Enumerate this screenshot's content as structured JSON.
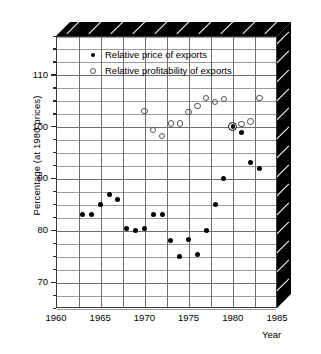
{
  "chart_data": {
    "type": "scatter",
    "title": "",
    "xlabel": "Year",
    "ylabel": "Percentage (at 1980 prices)",
    "xlim": [
      1960,
      1985
    ],
    "ylim": [
      65,
      117.5
    ],
    "xticks": [
      1960,
      1965,
      1970,
      1975,
      1980,
      1985
    ],
    "yticks": [
      70,
      80,
      90,
      100,
      110
    ],
    "y_minor_step": 2.5,
    "grid": true,
    "legend_position": "top-left inside",
    "series": [
      {
        "name": "Relative price of exports",
        "marker": "filled-circle",
        "color": "#000000",
        "points": [
          {
            "x": 1963,
            "y": 83.0
          },
          {
            "x": 1964,
            "y": 83.0
          },
          {
            "x": 1965,
            "y": 85.0
          },
          {
            "x": 1966,
            "y": 87.0
          },
          {
            "x": 1967,
            "y": 86.0
          },
          {
            "x": 1968,
            "y": 80.4
          },
          {
            "x": 1969,
            "y": 79.9
          },
          {
            "x": 1970,
            "y": 80.4
          },
          {
            "x": 1971,
            "y": 83.0
          },
          {
            "x": 1972,
            "y": 83.0
          },
          {
            "x": 1973,
            "y": 78.0
          },
          {
            "x": 1974,
            "y": 75.0
          },
          {
            "x": 1975,
            "y": 78.3
          },
          {
            "x": 1976,
            "y": 75.4
          },
          {
            "x": 1977,
            "y": 79.9
          },
          {
            "x": 1978,
            "y": 85.0
          },
          {
            "x": 1979,
            "y": 90.0
          },
          {
            "x": 1980,
            "y": 100.0
          },
          {
            "x": 1981,
            "y": 98.8
          },
          {
            "x": 1982,
            "y": 93.0
          },
          {
            "x": 1983,
            "y": 92.0
          }
        ]
      },
      {
        "name": "Relative profitability of exports",
        "marker": "open-circle",
        "color": "#555555",
        "points": [
          {
            "x": 1970,
            "y": 103.0
          },
          {
            "x": 1971,
            "y": 99.4
          },
          {
            "x": 1972,
            "y": 98.2
          },
          {
            "x": 1973,
            "y": 100.6
          },
          {
            "x": 1974,
            "y": 100.6
          },
          {
            "x": 1975,
            "y": 102.8
          },
          {
            "x": 1976,
            "y": 104.0
          },
          {
            "x": 1977,
            "y": 105.5
          },
          {
            "x": 1978,
            "y": 104.8
          },
          {
            "x": 1979,
            "y": 105.4
          },
          {
            "x": 1980,
            "y": 100.0
          },
          {
            "x": 1981,
            "y": 100.5
          },
          {
            "x": 1982,
            "y": 101.0
          },
          {
            "x": 1983,
            "y": 105.5
          }
        ]
      }
    ],
    "overlap_markers": [
      {
        "x": 1980,
        "y": 100.0,
        "note": "both series coincide"
      }
    ]
  },
  "legend": {
    "items": [
      {
        "marker": "filled-circle",
        "label": "Relative price of exports"
      },
      {
        "marker": "open-circle",
        "label": "Relative profitability of exports"
      }
    ]
  },
  "axes": {
    "y_title": "Percentage (at 1980 prices)",
    "x_title": "Year",
    "y_tick_labels": [
      "110",
      "100",
      "90",
      "80",
      "70"
    ],
    "x_tick_labels": [
      "1960",
      "1965",
      "1970",
      "1975",
      "1980",
      "1985"
    ]
  },
  "colors": {
    "slab": "#000000",
    "grid": "#9a9a9a",
    "grid_major": "#6e6e6e",
    "frame": "#3a3a3a",
    "filled_marker": "#000000",
    "open_marker": "#555555"
  }
}
